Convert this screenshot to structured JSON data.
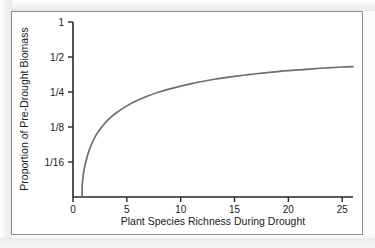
{
  "chart_data": {
    "type": "line",
    "title": "",
    "xlabel": "Plant Species Richness During Drought",
    "ylabel": "Proportion of Pre-Drought Biomass",
    "xlim": [
      0,
      26
    ],
    "ylim": [
      0.03125,
      1
    ],
    "yscale": "log2",
    "grid": false,
    "legend": null,
    "x_ticks": [
      0,
      5,
      10,
      15,
      20,
      25
    ],
    "x_tick_labels": [
      "0",
      "5",
      "10",
      "15",
      "20",
      "25"
    ],
    "y_ticks": [
      1,
      0.5,
      0.25,
      0.125,
      0.0625
    ],
    "y_tick_labels": [
      "1",
      "1/2",
      "1/4",
      "1/8",
      "1/16"
    ],
    "series": [
      {
        "name": "Drought resistance vs species richness",
        "color": "#6e6e6e",
        "x": [
          0.85,
          1.0,
          1.2,
          1.5,
          2.0,
          2.5,
          3.0,
          3.5,
          4.0,
          5.0,
          6.0,
          7.0,
          8.0,
          9.0,
          10.0,
          11.0,
          12.0,
          13.0,
          14.0,
          15.0,
          16.0,
          17.0,
          18.0,
          19.0,
          20.0,
          21.0,
          22.0,
          23.0,
          24.0,
          25.0,
          26.0
        ],
        "y": [
          0.04,
          0.052,
          0.063,
          0.079,
          0.101,
          0.119,
          0.136,
          0.151,
          0.165,
          0.19,
          0.212,
          0.232,
          0.25,
          0.266,
          0.281,
          0.295,
          0.308,
          0.32,
          0.331,
          0.341,
          0.35,
          0.359,
          0.367,
          0.375,
          0.382,
          0.388,
          0.394,
          0.4,
          0.405,
          0.41,
          0.414
        ]
      }
    ]
  },
  "figure": {
    "y_axis_title": "Proportion of Pre-Drought Biomass",
    "x_axis_title": "Plant Species Richness During Drought",
    "colors": {
      "curve": "#6e6e6e",
      "axis": "#262626",
      "frame": "#8c8c8c",
      "text": "#1a1a1a",
      "plot_background": "#ffffff"
    }
  }
}
